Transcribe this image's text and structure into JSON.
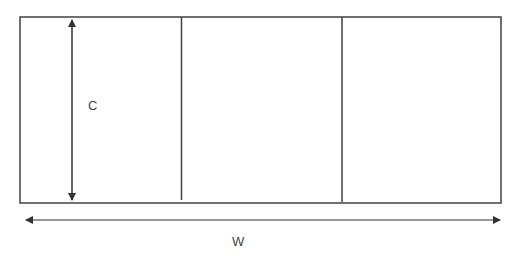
{
  "diagram": {
    "labels": {
      "height": "C",
      "width": "W"
    },
    "panels": 3,
    "colors": {
      "stroke": "#404040",
      "text": "#444444",
      "background": "#ffffff"
    }
  }
}
